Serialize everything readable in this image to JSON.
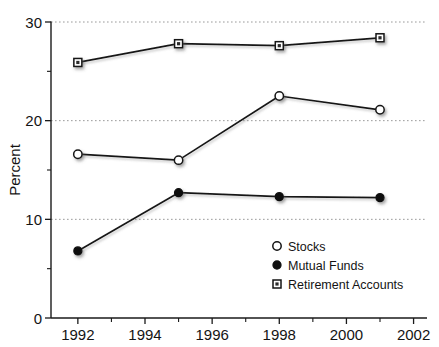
{
  "chart_data": {
    "type": "line",
    "title": "",
    "xlabel": "",
    "ylabel": "Percent",
    "xlim": [
      1991.2,
      2002.4
    ],
    "ylim": [
      0,
      30
    ],
    "grid": true,
    "gridlines_y": [
      10,
      20,
      30
    ],
    "legend_position": "inside-bottom-right",
    "x": [
      1992,
      1995,
      1998,
      2001
    ],
    "xticks": [
      1992,
      1994,
      1996,
      1998,
      2000,
      2002
    ],
    "xtick_labels": [
      "1992",
      "1994",
      "1996",
      "1998",
      "2000",
      "2002"
    ],
    "xticks_minor": [
      1993,
      1995,
      1997,
      1999,
      2001
    ],
    "yticks": [
      0,
      10,
      20,
      30
    ],
    "ytick_labels": [
      "0",
      "10",
      "20",
      "30"
    ],
    "yticks_minor": [
      5,
      15,
      25
    ],
    "series": [
      {
        "name": "Stocks",
        "marker": "open-circle",
        "values": [
          16.6,
          16.0,
          22.5,
          21.1
        ]
      },
      {
        "name": "Mutual Funds",
        "marker": "filled-circle",
        "values": [
          6.8,
          12.7,
          12.3,
          12.2
        ]
      },
      {
        "name": "Retirement Accounts",
        "marker": "open-square",
        "values": [
          25.9,
          27.8,
          27.6,
          28.4
        ]
      }
    ],
    "colors": {
      "line": "#171717",
      "marker_fill_open": "#ffffff",
      "marker_fill_solid": "#111111",
      "grid": "#9a9a9a",
      "axis": "#1a1a1a",
      "text": "#141414"
    }
  },
  "axis": {
    "y_label": "Percent"
  },
  "legend": {
    "items": [
      {
        "label": "Stocks",
        "marker": "open-circle"
      },
      {
        "label": "Mutual Funds",
        "marker": "filled-circle"
      },
      {
        "label": "Retirement Accounts",
        "marker": "open-square"
      }
    ]
  }
}
